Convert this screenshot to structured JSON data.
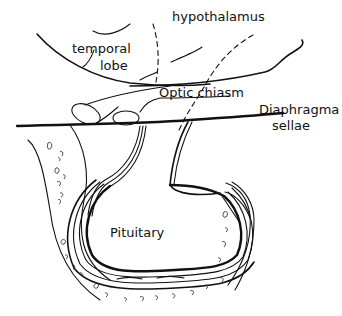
{
  "figure": {
    "type": "anatomical line drawing",
    "labels": {
      "hypothalamus": "hypothalamus",
      "temporal_lobe_line1": "temporal",
      "temporal_lobe_line2": "lobe",
      "optic_chiasm": "Optic chiasm",
      "diaphragma_line1": "Diaphragma",
      "diaphragma_line2": "sellae",
      "pituitary": "Pituitary"
    },
    "line_color": "#111111",
    "background_color": "#ffffff"
  }
}
